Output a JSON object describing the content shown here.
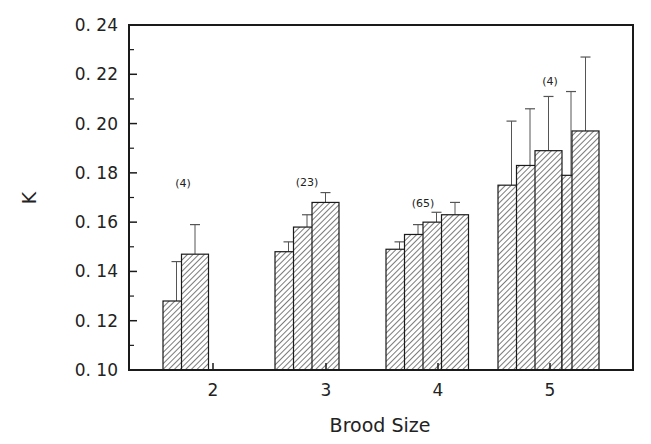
{
  "chart_data": {
    "type": "bar",
    "title": "",
    "xlabel": "Brood Size",
    "ylabel": "K",
    "ylim": [
      0.1,
      0.24
    ],
    "yticks": [
      "0. 10",
      "0. 12",
      "0. 14",
      "0. 16",
      "0. 18",
      "0. 20",
      "0. 22",
      "0. 24"
    ],
    "ytick_values": [
      0.1,
      0.12,
      0.14,
      0.16,
      0.18,
      0.2,
      0.22,
      0.24
    ],
    "grid": false,
    "legend": null,
    "bar_pattern": "diagonal-hatch",
    "error_bars": "upper, +1 SE",
    "categories": [
      "2",
      "3",
      "4",
      "5"
    ],
    "groups": [
      {
        "category": "2",
        "n_label": "(4)",
        "values": [
          0.128,
          0.147
        ],
        "error_upper": [
          0.144,
          0.159
        ]
      },
      {
        "category": "3",
        "n_label": "(23)",
        "values": [
          0.148,
          0.158,
          0.168
        ],
        "error_upper": [
          0.152,
          0.163,
          0.172
        ]
      },
      {
        "category": "4",
        "n_label": "(65)",
        "values": [
          0.149,
          0.155,
          0.16,
          0.163
        ],
        "error_upper": [
          0.152,
          0.159,
          0.164,
          0.168
        ]
      },
      {
        "category": "5",
        "n_label": "(4)",
        "values": [
          0.175,
          0.183,
          0.189,
          0.179,
          0.197
        ],
        "error_upper": [
          0.201,
          0.206,
          0.211,
          0.213,
          0.227
        ]
      }
    ]
  },
  "colors": {
    "axis": "#1a1a1a",
    "bar_fill": "#ffffff",
    "hatch": "#333333",
    "text": "#222222"
  }
}
